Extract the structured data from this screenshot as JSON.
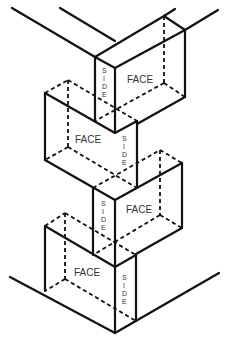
{
  "diagram": {
    "type": "isometric-box-joint",
    "labels": {
      "box1": {
        "face": "FACE",
        "side": [
          "S",
          "I",
          "D",
          "E"
        ]
      },
      "box2": {
        "face": "FACE",
        "side": [
          "S",
          "I",
          "D",
          "E"
        ]
      },
      "box3": {
        "face": "FACE",
        "side": [
          "S",
          "I",
          "D",
          "E"
        ]
      },
      "box4": {
        "face": "FACE",
        "side": [
          "S",
          "I",
          "D",
          "E"
        ]
      }
    },
    "colors": {
      "line": "#111111",
      "text": "#333333",
      "background": "#ffffff"
    }
  }
}
